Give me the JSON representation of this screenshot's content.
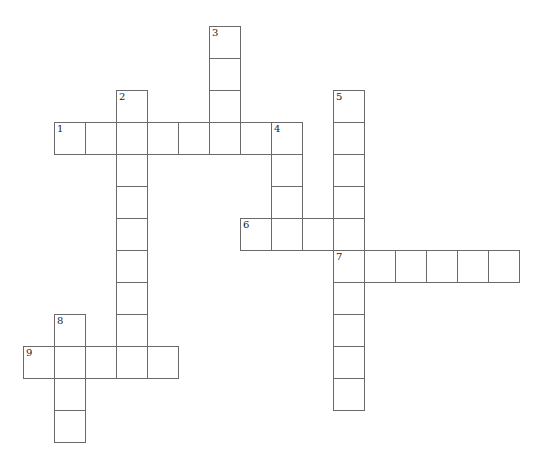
{
  "puzzle": {
    "type": "crossword",
    "grid_origin": {
      "x": 23,
      "y": 26
    },
    "cell_size": {
      "w": 31,
      "h": 32
    },
    "entries": [
      {
        "number": "1",
        "direction": "across",
        "row": 3,
        "col": 1,
        "length": 8
      },
      {
        "number": "2",
        "direction": "down",
        "row": 2,
        "col": 3,
        "length": 9
      },
      {
        "number": "3",
        "direction": "down",
        "row": 0,
        "col": 6,
        "length": 4
      },
      {
        "number": "4",
        "direction": "down",
        "row": 3,
        "col": 8,
        "length": 4
      },
      {
        "number": "5",
        "direction": "down",
        "row": 2,
        "col": 10,
        "length": 10
      },
      {
        "number": "6",
        "direction": "across",
        "row": 6,
        "col": 7,
        "length": 4
      },
      {
        "number": "7",
        "direction": "across",
        "row": 7,
        "col": 10,
        "length": 6
      },
      {
        "number": "8",
        "direction": "down",
        "row": 9,
        "col": 1,
        "length": 4
      },
      {
        "number": "9",
        "direction": "across",
        "row": 10,
        "col": 0,
        "length": 5
      }
    ]
  }
}
